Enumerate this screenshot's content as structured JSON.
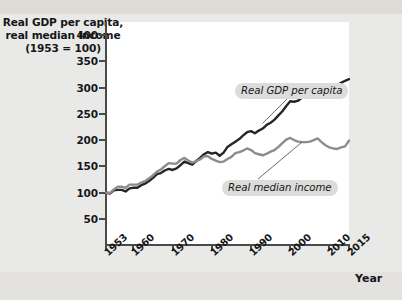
{
  "axis_title": {
    "line1": "Real GDP per capita,",
    "line2": "real median income",
    "line3": "(1953 = 100)"
  },
  "x_axis_title": "Year",
  "callouts": {
    "gdp": "Real GDP per capita",
    "income": "Real median income"
  },
  "colors": {
    "gdp_line": "#26262a",
    "income_line": "#8c8c8c",
    "axis": "#4a4a4a",
    "panel": "#ffffff",
    "page": "#e9e9e7",
    "callout_bg": "#dcdcda"
  },
  "chart_data": {
    "type": "line",
    "title": "Real GDP per capita, real median income (1953 = 100)",
    "xlabel": "Year",
    "ylabel": "Real GDP per capita, real median income (1953 = 100)",
    "xlim": [
      1953,
      2015
    ],
    "ylim": [
      0,
      425
    ],
    "grid": false,
    "legend_position": "inline-callouts",
    "ytick_labels": [
      "50",
      "100",
      "150",
      "200",
      "250",
      "300",
      "350",
      "400"
    ],
    "yticks": [
      50,
      100,
      150,
      200,
      250,
      300,
      350,
      400
    ],
    "xtick_labels": [
      "1953",
      "1960",
      "1970",
      "1980",
      "1990",
      "2000",
      "2010",
      "2015"
    ],
    "xticks": [
      1953,
      1960,
      1970,
      1980,
      1990,
      2000,
      2010,
      2015
    ],
    "x": [
      1953,
      1954,
      1955,
      1956,
      1957,
      1958,
      1959,
      1960,
      1961,
      1962,
      1963,
      1964,
      1965,
      1966,
      1967,
      1968,
      1969,
      1970,
      1971,
      1972,
      1973,
      1974,
      1975,
      1976,
      1977,
      1978,
      1979,
      1980,
      1981,
      1982,
      1983,
      1984,
      1985,
      1986,
      1987,
      1988,
      1989,
      1990,
      1991,
      1992,
      1993,
      1994,
      1995,
      1996,
      1997,
      1998,
      1999,
      2000,
      2001,
      2002,
      2003,
      2004,
      2005,
      2006,
      2007,
      2008,
      2009,
      2010,
      2011,
      2012,
      2013,
      2014,
      2015
    ],
    "series": [
      {
        "name": "Real GDP per capita",
        "color": "#26262a",
        "values": [
          100,
          98,
          104,
          105,
          105,
          102,
          108,
          109,
          109,
          114,
          117,
          122,
          128,
          135,
          137,
          142,
          145,
          143,
          146,
          152,
          159,
          156,
          153,
          160,
          166,
          173,
          177,
          174,
          176,
          170,
          176,
          187,
          192,
          197,
          202,
          209,
          215,
          217,
          213,
          218,
          222,
          229,
          233,
          239,
          247,
          255,
          265,
          274,
          273,
          275,
          281,
          289,
          296,
          302,
          305,
          301,
          290,
          296,
          300,
          305,
          309,
          313,
          316
        ]
      },
      {
        "name": "Real median income",
        "color": "#8c8c8c",
        "values": [
          100,
          99,
          106,
          111,
          111,
          109,
          115,
          115,
          115,
          119,
          122,
          127,
          133,
          140,
          144,
          150,
          156,
          155,
          155,
          162,
          166,
          161,
          157,
          160,
          163,
          169,
          169,
          164,
          161,
          158,
          159,
          164,
          168,
          175,
          177,
          180,
          184,
          181,
          175,
          173,
          171,
          174,
          178,
          181,
          187,
          194,
          201,
          204,
          200,
          197,
          196,
          196,
          197,
          200,
          203,
          196,
          190,
          186,
          184,
          183,
          186,
          188,
          199
        ]
      }
    ],
    "annotations": [
      {
        "text": "Real GDP per capita",
        "points_to_year": 1993,
        "points_to_value": 232
      },
      {
        "text": "Real median income",
        "points_to_year": 2003,
        "points_to_value": 196
      }
    ]
  }
}
